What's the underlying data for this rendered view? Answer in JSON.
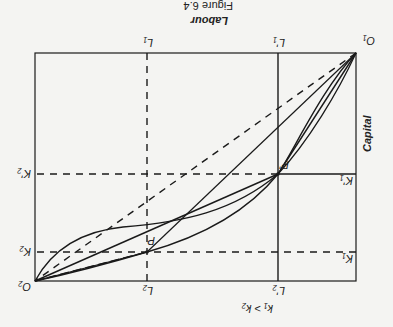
{
  "figure": {
    "caption": "Figure 6.4",
    "axis_top": "Labour",
    "axis_side": "Capital",
    "inequality": "k₁ > k₂",
    "rotation_deg": 180
  },
  "origins": {
    "o1": "O₁",
    "o2": "O₂"
  },
  "labels": {
    "L1": "L₁",
    "L2": "L₂",
    "L1p": "L'₁",
    "L2p": "L'₂",
    "K1": "K₁",
    "K2": "K₂",
    "K1p": "K'₁",
    "K2p": "K'₂",
    "P": "P",
    "Pp": "P'"
  },
  "colors": {
    "line": "#1a1a1a",
    "background": "#f4f4f2"
  }
}
